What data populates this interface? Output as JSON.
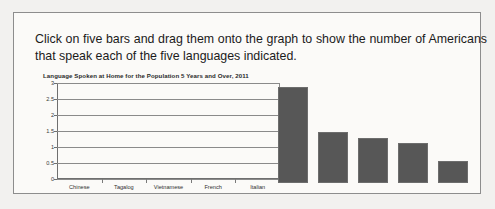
{
  "panel": {
    "instruction": "Click on five bars and drag them onto the graph to show the number of Americans that speak each of the five languages indicated."
  },
  "chart_data": {
    "type": "bar",
    "title": "Language Spoken at Home for the Population 5 Years and Over, 2011",
    "xlabel": "",
    "ylabel": "",
    "categories": [
      "Chinese",
      "Tagalog",
      "Vietnamese",
      "French",
      "Italian"
    ],
    "values": [
      null,
      null,
      null,
      null,
      null
    ],
    "ylim": [
      0,
      3
    ],
    "yticks": [
      "0",
      "0.5",
      "1",
      "1.5",
      "2",
      "2.5",
      "3"
    ],
    "ytick_values": [
      0,
      0.5,
      1,
      1.5,
      2,
      2.5,
      3
    ],
    "grid": true,
    "legend": "none",
    "note": "Plot area is empty; bars must be dragged in by the user."
  },
  "draggable_bars": {
    "label": "draggable-bar-tray",
    "bars": [
      {
        "name": "bar-1",
        "value": 3.0
      },
      {
        "name": "bar-2",
        "value": 1.6
      },
      {
        "name": "bar-3",
        "value": 1.4
      },
      {
        "name": "bar-4",
        "value": 1.25
      },
      {
        "name": "bar-5",
        "value": 0.7
      }
    ]
  },
  "colors": {
    "bar_fill": "#575757",
    "panel_border": "#8d8d8d",
    "page_background": "#f2f1ef",
    "axis": "#6f6f6f"
  }
}
